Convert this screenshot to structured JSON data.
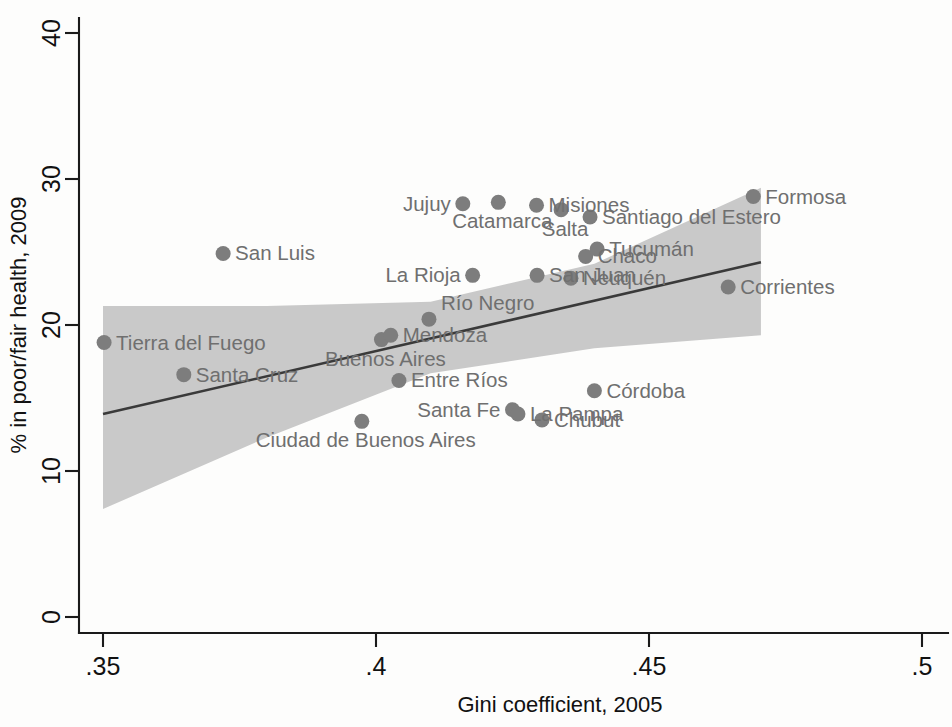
{
  "chart_data": {
    "type": "scatter",
    "title": "",
    "xlabel": "Gini coefficient, 2005",
    "ylabel": "% in poor/fair health, 2009",
    "xlim": [
      0.35,
      0.5
    ],
    "ylim": [
      0,
      40
    ],
    "xticks": [
      ".35",
      ".4",
      ".45",
      ".5"
    ],
    "xtick_values": [
      0.35,
      0.4,
      0.45,
      0.5
    ],
    "yticks": [
      "0",
      "10",
      "20",
      "30",
      "40"
    ],
    "ytick_values": [
      0,
      10,
      20,
      30,
      40
    ],
    "grid": false,
    "legend": "none",
    "marker_color": "#7d7d7d",
    "band_color": "#c9c9c9",
    "line_color": "#3a3a3a",
    "annotations": [
      "Linear fit line with shaded 95% confidence interval band"
    ],
    "points": [
      {
        "label": "Tierra del Fuego",
        "x": 0.3502,
        "y": 18.8,
        "label_pos": "right"
      },
      {
        "label": "Santa Cruz",
        "x": 0.3648,
        "y": 16.6,
        "label_pos": "right"
      },
      {
        "label": "San Luis",
        "x": 0.372,
        "y": 24.9,
        "label_pos": "right"
      },
      {
        "label": "Ciudad de Buenos Aires",
        "x": 0.3974,
        "y": 13.4,
        "label_pos": "below"
      },
      {
        "label": "Buenos Aires",
        "x": 0.401,
        "y": 19.0,
        "label_pos": "below"
      },
      {
        "label": "Mendoza",
        "x": 0.4027,
        "y": 19.3,
        "label_pos": "right"
      },
      {
        "label": "Entre Ríos",
        "x": 0.4042,
        "y": 16.2,
        "label_pos": "right"
      },
      {
        "label": "Río Negro",
        "x": 0.4097,
        "y": 20.4,
        "label_pos": "above"
      },
      {
        "label": "Jujuy",
        "x": 0.4159,
        "y": 28.3,
        "label_pos": "left"
      },
      {
        "label": "La Rioja",
        "x": 0.4177,
        "y": 23.4,
        "label_pos": "left"
      },
      {
        "label": "Catamarca",
        "x": 0.4224,
        "y": 28.4,
        "label_pos": "below"
      },
      {
        "label": "San Juan",
        "x": 0.4295,
        "y": 23.4,
        "label_pos": "right"
      },
      {
        "label": "Santa Fe",
        "x": 0.425,
        "y": 14.2,
        "label_pos": "left"
      },
      {
        "label": "La Pampa",
        "x": 0.426,
        "y": 13.9,
        "label_pos": "right"
      },
      {
        "label": "Chubut",
        "x": 0.4304,
        "y": 13.5,
        "label_pos": "right"
      },
      {
        "label": "Misiones",
        "x": 0.4294,
        "y": 28.2,
        "label_pos": "right"
      },
      {
        "label": "Chaco",
        "x": 0.4384,
        "y": 24.7,
        "label_pos": "right"
      },
      {
        "label": "Salta",
        "x": 0.4339,
        "y": 27.9,
        "label_pos": "below"
      },
      {
        "label": "Córdoba",
        "x": 0.44,
        "y": 15.5,
        "label_pos": "right"
      },
      {
        "label": "Santiago del Estero",
        "x": 0.4392,
        "y": 27.4,
        "label_pos": "right"
      },
      {
        "label": "Neuquén",
        "x": 0.4357,
        "y": 23.2,
        "label_pos": "right"
      },
      {
        "label": "Tucumán",
        "x": 0.4405,
        "y": 25.2,
        "label_pos": "right"
      },
      {
        "label": "Corrientes",
        "x": 0.4645,
        "y": 22.6,
        "label_pos": "right"
      },
      {
        "label": "Formosa",
        "x": 0.4691,
        "y": 28.8,
        "label_pos": "right"
      }
    ],
    "fit_line": {
      "x0": 0.35,
      "y0": 13.9,
      "x1": 0.4705,
      "y1": 24.3
    },
    "ci_band": {
      "upper": [
        {
          "x": 0.35,
          "y": 21.3
        },
        {
          "x": 0.38,
          "y": 21.3
        },
        {
          "x": 0.41,
          "y": 21.6
        },
        {
          "x": 0.44,
          "y": 24.2
        },
        {
          "x": 0.4705,
          "y": 29.4
        }
      ],
      "lower": [
        {
          "x": 0.35,
          "y": 7.4
        },
        {
          "x": 0.38,
          "y": 12.3
        },
        {
          "x": 0.41,
          "y": 16.7
        },
        {
          "x": 0.44,
          "y": 18.4
        },
        {
          "x": 0.4705,
          "y": 19.3
        }
      ]
    }
  }
}
